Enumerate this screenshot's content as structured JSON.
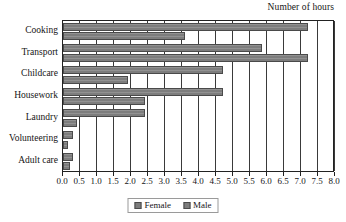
{
  "chart_data": {
    "type": "bar",
    "orientation": "horizontal",
    "title": "Number of hours",
    "xlabel": "",
    "ylabel": "",
    "xlim": [
      0.0,
      8.0
    ],
    "xtick_step": 0.5,
    "grid": true,
    "legend_position": "bottom",
    "categories": [
      "Cooking",
      "Transport",
      "Childcare",
      "Housework",
      "Laundry",
      "Volunteering",
      "Adult care"
    ],
    "xticks": [
      "0.0",
      "0.5",
      "1.0",
      "1.5",
      "2.0",
      "2.5",
      "3.0",
      "3.5",
      "4.0",
      "4.5",
      "5.0",
      "5.5",
      "6.0",
      "6.5",
      "7.0",
      "7.5",
      "8.0"
    ],
    "series": [
      {
        "name": "Female",
        "color": "#7d7d7d",
        "values": [
          7.2,
          5.85,
          4.7,
          4.7,
          2.4,
          0.3,
          0.3
        ]
      },
      {
        "name": "Male",
        "color": "#7d7d7d",
        "values": [
          3.6,
          7.2,
          1.9,
          2.4,
          0.4,
          0.15,
          0.2
        ]
      }
    ]
  },
  "legend": {
    "items": [
      {
        "label": "Female"
      },
      {
        "label": "Male"
      }
    ]
  }
}
